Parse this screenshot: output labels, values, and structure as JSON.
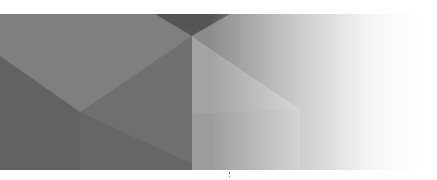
{
  "banner": {
    "description": "Decorative geometric gray banner with gradient fade to white",
    "colors": {
      "dark": "#5e5e5e",
      "mid": "#777777",
      "light": "#9a9a9a",
      "lighter": "#a8a8a8",
      "fade_to": "#ffffff"
    }
  }
}
